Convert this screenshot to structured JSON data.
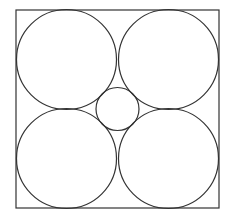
{
  "diagram": {
    "title": "",
    "stroke_color": "#333333",
    "background": "#ffffff",
    "square": {
      "x": 16,
      "y": 10,
      "width": 203,
      "height": 198
    },
    "large_circles": [
      {
        "name": "top-left",
        "cx": 66.5,
        "cy": 59.5,
        "r": 50
      },
      {
        "name": "top-right",
        "cx": 168.5,
        "cy": 59.5,
        "r": 50
      },
      {
        "name": "bottom-left",
        "cx": 66.5,
        "cy": 158.5,
        "r": 50
      },
      {
        "name": "bottom-right",
        "cx": 168.5,
        "cy": 158.5,
        "r": 50
      }
    ],
    "small_circle": {
      "name": "center",
      "cx": 117.5,
      "cy": 109,
      "r": 21.5
    }
  }
}
